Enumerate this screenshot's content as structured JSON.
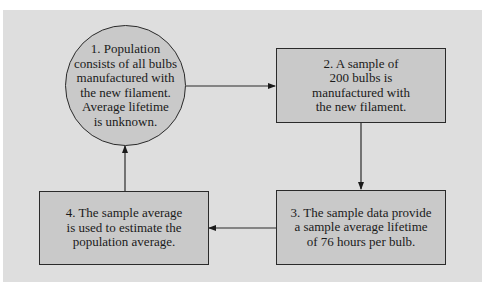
{
  "diagram": {
    "nodes": [
      {
        "id": "1",
        "shape": "circle",
        "text": "1.  Population\nconsists of all bulbs\nmanufactured with\nthe new filament.\nAverage lifetime\nis unknown."
      },
      {
        "id": "2",
        "shape": "rect",
        "text": "2.  A sample of\n200 bulbs is\nmanufactured with\nthe new filament."
      },
      {
        "id": "3",
        "shape": "rect",
        "text": "3.  The sample data provide\na sample average lifetime\nof 76 hours per bulb."
      },
      {
        "id": "4",
        "shape": "rect",
        "text": "4.  The sample average\nis used to estimate the\npopulation average."
      }
    ],
    "edges": [
      {
        "from": "1",
        "to": "2"
      },
      {
        "from": "2",
        "to": "3"
      },
      {
        "from": "3",
        "to": "4"
      },
      {
        "from": "4",
        "to": "1"
      }
    ],
    "colors": {
      "panel_bg": "#dedede",
      "node_fill": "#c9c9c9",
      "stroke": "#2a2a2a"
    }
  }
}
